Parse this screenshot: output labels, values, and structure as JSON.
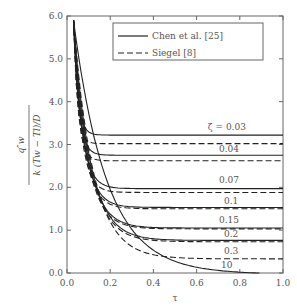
{
  "chart_data": {
    "type": "line",
    "title": "",
    "xlabel": "τ",
    "ylabel": "q_w^s / (k (T_w − T_l) / D)",
    "xlim": [
      0.0,
      1.0
    ],
    "ylim": [
      0.0,
      6.0
    ],
    "xticks": [
      "0.0",
      "0.2",
      "0.4",
      "0.6",
      "0.8",
      "1.0"
    ],
    "yticks": [
      "0.0",
      "1.0",
      "2.0",
      "3.0",
      "4.0",
      "5.0",
      "6.0"
    ],
    "grid": false,
    "legend": {
      "position": "upper right",
      "entries": [
        {
          "label": "Chen et al. [25]",
          "style": "solid"
        },
        {
          "label": "Siegel [8]",
          "style": "dashed"
        }
      ]
    },
    "annotations": [
      {
        "text": "ζ = 0.03",
        "x": 0.74,
        "y": 3.35
      },
      {
        "text": "0.04",
        "x": 0.75,
        "y": 2.82
      },
      {
        "text": "0.07",
        "x": 0.75,
        "y": 2.1
      },
      {
        "text": "0.1",
        "x": 0.76,
        "y": 1.62
      },
      {
        "text": "0.15",
        "x": 0.75,
        "y": 1.17
      },
      {
        "text": "0.2",
        "x": 0.76,
        "y": 0.85
      },
      {
        "text": "0.3",
        "x": 0.76,
        "y": 0.45
      },
      {
        "text": "10",
        "x": 0.74,
        "y": 0.12
      }
    ],
    "series": [
      {
        "name": "Chen et al. [25] ζ=0.03",
        "style": "solid",
        "plateau": 3.22,
        "tau_knee": 0.12
      },
      {
        "name": "Siegel [8] ζ=0.03",
        "style": "dashed",
        "plateau": 3.02,
        "tau_knee": 0.11
      },
      {
        "name": "Chen et al. [25] ζ=0.04",
        "style": "solid",
        "plateau": 2.75,
        "tau_knee": 0.14
      },
      {
        "name": "Siegel [8] ζ=0.04",
        "style": "dashed",
        "plateau": 2.62,
        "tau_knee": 0.13
      },
      {
        "name": "Chen et al. [25] ζ=0.07",
        "style": "solid",
        "plateau": 1.97,
        "tau_knee": 0.2
      },
      {
        "name": "Siegel [8] ζ=0.07",
        "style": "dashed",
        "plateau": 1.88,
        "tau_knee": 0.19
      },
      {
        "name": "Chen et al. [25] ζ=0.1",
        "style": "solid",
        "plateau": 1.53,
        "tau_knee": 0.25
      },
      {
        "name": "Siegel [8] ζ=0.1",
        "style": "dashed",
        "plateau": 1.5,
        "tau_knee": 0.24
      },
      {
        "name": "Chen et al. [25] ζ=0.15",
        "style": "solid",
        "plateau": 1.05,
        "tau_knee": 0.32
      },
      {
        "name": "Siegel [8] ζ=0.15",
        "style": "dashed",
        "plateau": 1.03,
        "tau_knee": 0.31
      },
      {
        "name": "Chen et al. [25] ζ=0.2",
        "style": "solid",
        "plateau": 0.76,
        "tau_knee": 0.38
      },
      {
        "name": "Siegel [8] ζ=0.2",
        "style": "dashed",
        "plateau": 0.73,
        "tau_knee": 0.37
      },
      {
        "name": "Siegel [8] ζ=0.3",
        "style": "dashed",
        "plateau": 0.33,
        "tau_knee": 0.45
      },
      {
        "name": "Chen et al. [25] ζ=10",
        "style": "solid",
        "plateau": 0.0,
        "tau_knee": 0.9
      }
    ],
    "common_start": {
      "tau": 0.03,
      "value": 5.9
    }
  }
}
